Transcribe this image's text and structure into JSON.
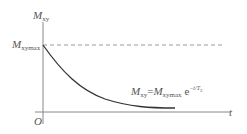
{
  "diagram": {
    "type": "exponential-decay-plot",
    "y_axis": {
      "symbol": "M",
      "subscript": "xy"
    },
    "x_axis": {
      "symbol": "t"
    },
    "origin": "O",
    "max_level": {
      "symbol": "M",
      "subscript": "xymax",
      "line_style": "dashed"
    },
    "formula": {
      "lhs_symbol": "M",
      "lhs_subscript": "xy",
      "equals": "=",
      "rhs_symbol": "M",
      "rhs_subscript": "xymax",
      "base": "e",
      "exponent": "−t/T",
      "exponent_subscript": "2"
    },
    "colors": {
      "axis": "#777777",
      "curve": "#333333",
      "dashed": "#888888",
      "text": "#555555"
    }
  }
}
